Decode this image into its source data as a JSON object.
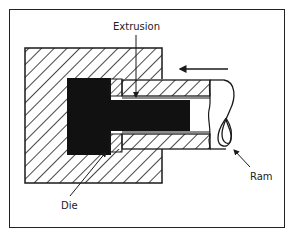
{
  "diagram": {
    "labels": {
      "extrusion": "Extrusion",
      "die": "Die",
      "ram": "Ram"
    },
    "colors": {
      "ink": "#1a1a1a",
      "background": "#ffffff",
      "billet": "#111111"
    },
    "components": [
      "container",
      "billet",
      "die",
      "extrusion",
      "ram",
      "direction-arrow"
    ],
    "direction_arrow": "left"
  }
}
